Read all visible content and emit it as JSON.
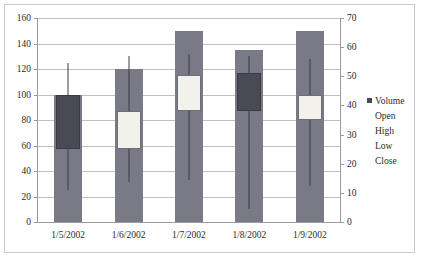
{
  "chart_data": {
    "type": "bar",
    "title": "",
    "subtitle": "",
    "xlabel": "",
    "ylabel": "",
    "grid": true,
    "legend_position": "right",
    "categories": [
      "1/5/2002",
      "1/6/2002",
      "1/7/2002",
      "1/8/2002",
      "1/9/2002"
    ],
    "left_axis": {
      "name": "Volume",
      "min": 0,
      "max": 160,
      "step": 20,
      "ticks": [
        "0",
        "20",
        "40",
        "60",
        "80",
        "100",
        "120",
        "140",
        "160"
      ]
    },
    "right_axis": {
      "name": "Price",
      "min": 0,
      "max": 70,
      "step": 10,
      "ticks": [
        "0",
        "10",
        "20",
        "30",
        "40",
        "50",
        "60",
        "70"
      ]
    },
    "series": [
      {
        "name": "Volume",
        "values": [
          100,
          120,
          150,
          135,
          150
        ]
      },
      {
        "name": "Open",
        "values": [
          44,
          25,
          38,
          51,
          35
        ]
      },
      {
        "name": "High",
        "values": [
          55,
          57,
          58,
          57,
          62
        ]
      },
      {
        "name": "Low",
        "values": [
          11,
          14,
          15,
          4,
          12
        ]
      },
      {
        "name": "Close",
        "values": [
          25,
          38,
          50,
          44,
          44
        ]
      }
    ],
    "candles": [
      {
        "category": "1/5/2002",
        "body_low": 57,
        "body_high": 100,
        "hl_low": 25,
        "hl_high": 125,
        "direction": "down"
      },
      {
        "category": "1/6/2002",
        "body_low": 57,
        "body_high": 87,
        "hl_low": 31,
        "hl_high": 130,
        "direction": "up"
      },
      {
        "category": "1/7/2002",
        "body_low": 87,
        "body_high": 115,
        "hl_low": 33,
        "hl_high": 132,
        "direction": "up"
      },
      {
        "category": "1/8/2002",
        "body_low": 87,
        "body_high": 117,
        "hl_low": 10,
        "hl_high": 130,
        "direction": "down"
      },
      {
        "category": "1/9/2002",
        "body_low": 80,
        "body_high": 100,
        "hl_low": 28,
        "hl_high": 128,
        "direction": "up"
      }
    ],
    "colors": {
      "volume_bar": "#7a7a86",
      "candle_down": "#4a4a55",
      "candle_up": "#f2f2ea",
      "gridline": "#bfbfbf",
      "axis": "#9a9a9a",
      "text": "#2b2b2b",
      "frame": "#c9c9c9"
    }
  },
  "legend": {
    "items": [
      {
        "label": "Volume",
        "swatch": "#4a4a55",
        "has_swatch": true
      },
      {
        "label": "Open",
        "swatch": "",
        "has_swatch": false
      },
      {
        "label": "High",
        "swatch": "",
        "has_swatch": false
      },
      {
        "label": "Low",
        "swatch": "",
        "has_swatch": false
      },
      {
        "label": "Close",
        "swatch": "",
        "has_swatch": false
      }
    ]
  }
}
